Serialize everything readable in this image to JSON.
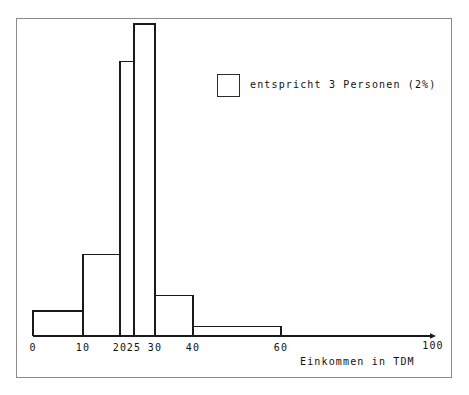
{
  "figure": {
    "background_color": "#ffffff",
    "frame_color": "#8a8a8a",
    "ink_color": "#1a1a1a"
  },
  "legend": {
    "label": "entspricht 3 Personen (2%)",
    "swatch_name": "legend-swatch",
    "position": "upper-right"
  },
  "axis": {
    "title": "Einkommen in TDM",
    "arrow_end_label": "100"
  },
  "chart_data": {
    "type": "bar",
    "title": "",
    "subtitle": "",
    "xlabel": "Einkommen in TDM",
    "ylabel": "",
    "xlim": [
      0,
      100
    ],
    "ylim": [
      0,
      100
    ],
    "grid": false,
    "legend_position": "upper-right",
    "legend_entries": [
      "entspricht 3 Personen (2%)"
    ],
    "note": "Histogram with unequal class widths; heights are relative frequency densities read off the drawn rectangles.",
    "tick_labels": [
      "0",
      "10",
      "20",
      "25",
      "30",
      "40",
      "60",
      "100"
    ],
    "tick_values": [
      0,
      10,
      20,
      25,
      30,
      40,
      60,
      100
    ],
    "bins": [
      {
        "label": "0-10",
        "x0": 0,
        "x1": 10,
        "height": 8
      },
      {
        "label": "10-20",
        "x0": 10,
        "x1": 20,
        "height": 26
      },
      {
        "label": "20-25",
        "x0": 20,
        "x1": 25,
        "height": 88
      },
      {
        "label": "25-30",
        "x0": 25,
        "x1": 30,
        "height": 100
      },
      {
        "label": "30-40",
        "x0": 30,
        "x1": 40,
        "height": 13
      },
      {
        "label": "40-60",
        "x0": 40,
        "x1": 60,
        "height": 3
      }
    ],
    "categories": [
      "0-10",
      "10-20",
      "20-25",
      "25-30",
      "30-40",
      "40-60"
    ],
    "values": [
      8,
      26,
      88,
      100,
      13,
      3
    ]
  }
}
